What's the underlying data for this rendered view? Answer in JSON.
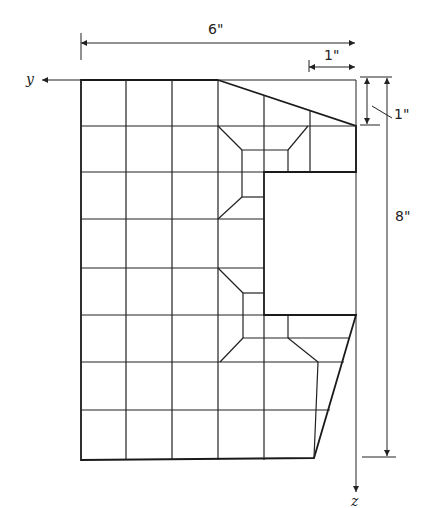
{
  "diagram": {
    "title": "",
    "axes": {
      "horizontal": "y",
      "vertical": "z"
    },
    "dimensions": {
      "width": "6\"",
      "top_right_offset": "1\"",
      "right_vertical_offset": "1\"",
      "height": "8\""
    },
    "colors": {
      "line": "#222222",
      "background": "#ffffff"
    }
  }
}
